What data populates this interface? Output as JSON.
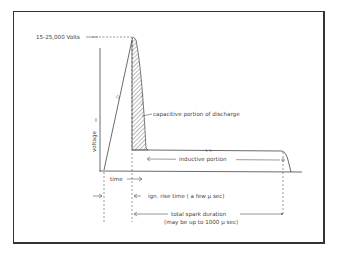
{
  "figure": {
    "peak_label": "15-25,000 Volts",
    "y_axis_label": "voltage",
    "x_axis_label": "time",
    "capacitive_label": "capacitive portion of discharge",
    "inductive_label": "inductive portion",
    "rise_time_label": "ign. rise time ( a few µ sec)",
    "duration_label_1": "total spark duration",
    "duration_label_2": "(may be up to 1000 µ sec)"
  }
}
